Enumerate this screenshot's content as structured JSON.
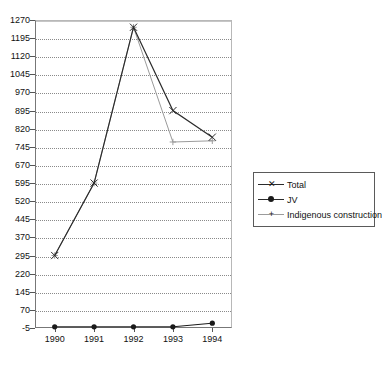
{
  "chart_data": {
    "type": "line",
    "title": "",
    "xlabel": "",
    "ylabel": "",
    "categories": [
      "1990",
      "1991",
      "1992",
      "1993",
      "1994"
    ],
    "ylim": [
      -5,
      1270
    ],
    "ytick_labels": [
      "1270",
      "1195",
      "1120",
      "1045",
      "970",
      "895",
      "820",
      "745",
      "670",
      "595",
      "520",
      "445",
      "370",
      "295",
      "220",
      "145",
      "70",
      "-5"
    ],
    "ytick_values": [
      1270,
      1195,
      1120,
      1045,
      970,
      895,
      820,
      745,
      670,
      595,
      520,
      445,
      370,
      295,
      220,
      145,
      70,
      -5
    ],
    "grid": true,
    "legend_position": "right",
    "series": [
      {
        "name": "Total",
        "marker": "x",
        "color": "#2b2b2b",
        "values": [
          295,
          595,
          1240,
          895,
          785
        ]
      },
      {
        "name": "JV",
        "marker": "filled-circle",
        "color": "#1a1a1a",
        "values": [
          0,
          0,
          0,
          0,
          15
        ]
      },
      {
        "name": "Indigenous construction",
        "marker": "plus",
        "color": "#9b9b9b",
        "values": [
          295,
          595,
          1240,
          765,
          770
        ]
      }
    ]
  },
  "legend": {
    "items": [
      {
        "label": "Total"
      },
      {
        "label": "JV"
      },
      {
        "label": "Indigenous construction"
      }
    ]
  }
}
